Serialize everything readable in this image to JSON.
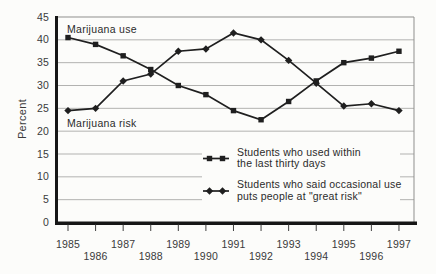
{
  "chart_data": {
    "type": "line",
    "title": "",
    "ylabel": "Percent",
    "ylim": [
      0,
      45
    ],
    "ytick_step": 5,
    "grid": true,
    "legend_position": "inside-bottom-right",
    "x": [
      1985,
      1986,
      1987,
      1988,
      1989,
      1990,
      1991,
      1992,
      1993,
      1994,
      1995,
      1996,
      1997
    ],
    "series": [
      {
        "name": "Marijuana use",
        "marker": "square",
        "legend_lines": [
          "Students who used within",
          "the last thirty days"
        ],
        "values": [
          40.5,
          39,
          36.5,
          33.5,
          30,
          28,
          24.5,
          22.5,
          26.5,
          31,
          35,
          36,
          37.5
        ]
      },
      {
        "name": "Marijuana risk",
        "marker": "diamond",
        "legend_lines": [
          "Students who said occasional use",
          "puts people at \"great risk\""
        ],
        "values": [
          24.5,
          25,
          31,
          32.5,
          37.5,
          38,
          41.5,
          40,
          35.5,
          30.5,
          25.5,
          26,
          24.5
        ]
      }
    ],
    "annotations": [
      {
        "text": "Marijuana use"
      },
      {
        "text": "Marijuana risk"
      }
    ],
    "colors": {
      "line": "#1f1f1f",
      "grid": "#b2b2b0",
      "border": "#8f8f8d",
      "axis": "#161616",
      "text": "#2b2b2b",
      "background": "#fcfcfa"
    }
  }
}
